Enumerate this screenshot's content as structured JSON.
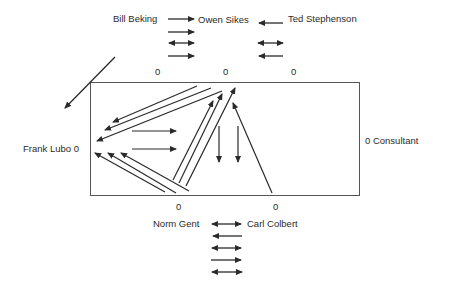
{
  "diagram": {
    "type": "sociogram",
    "people": {
      "bill": "Bill Beking",
      "owen": "Owen Sikes",
      "ted": "Ted Stephenson",
      "frank": "Frank Lubo 0",
      "consultant": "0  Consultant",
      "norm": "Norm Gent",
      "carl": "Carl Colbert"
    },
    "top_zeros": [
      "0",
      "0",
      "0"
    ],
    "bottom_zeros": [
      "0",
      "0"
    ],
    "relations": {
      "bill_owen": [
        "right",
        "right",
        "both",
        "right"
      ],
      "ted_owen": [
        "left",
        "both",
        "left"
      ],
      "norm_carl": [
        "both",
        "left",
        "both",
        "right",
        "both"
      ]
    },
    "colors": {
      "line": "#2a2a2a",
      "box": "#555555"
    }
  }
}
